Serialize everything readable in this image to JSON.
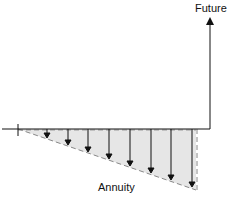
{
  "diagram": {
    "labels": {
      "future": "Future",
      "annuity": "Annuity"
    },
    "arrows_count": 8,
    "colors": {
      "line": "#111111",
      "fill": "#e6e6e6",
      "dash": "#888888"
    }
  }
}
